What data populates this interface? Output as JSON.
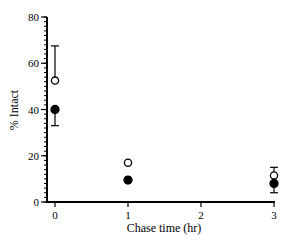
{
  "chart_data": {
    "type": "scatter",
    "title": "",
    "xlabel": "Chase time (hr)",
    "ylabel": "% Intact",
    "xlim": [
      0,
      3
    ],
    "ylim": [
      0,
      80
    ],
    "x_ticks": [
      "0",
      "1",
      "2",
      "3"
    ],
    "y_ticks": [
      "0",
      "20",
      "40",
      "60",
      "80"
    ],
    "grid": false,
    "legend": null,
    "series": [
      {
        "name": "open circles",
        "marker": "open-circle",
        "x": [
          0,
          1,
          3
        ],
        "values": [
          52.5,
          17,
          11.5
        ],
        "error_upper": [
          67.5,
          null,
          15
        ]
      },
      {
        "name": "filled circles",
        "marker": "filled-circle",
        "x": [
          0,
          1,
          3
        ],
        "values": [
          40,
          9.5,
          8
        ],
        "error_lower": [
          33,
          null,
          4
        ]
      }
    ]
  }
}
